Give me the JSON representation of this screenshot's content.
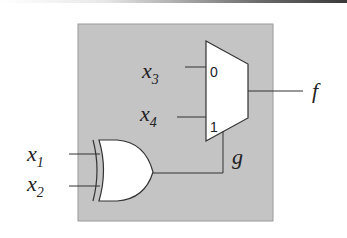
{
  "diagram": {
    "type": "logic-circuit",
    "block_color": "#c4c4c4",
    "gate": {
      "kind": "XOR",
      "inputs": [
        "x1",
        "x2"
      ],
      "output": "g"
    },
    "mux": {
      "inputs": {
        "0": "x3",
        "1": "x4"
      },
      "select": "g",
      "output": "f",
      "pin_labels": [
        "0",
        "1"
      ]
    },
    "labels": {
      "x1": {
        "base": "x",
        "sub": "1"
      },
      "x2": {
        "base": "x",
        "sub": "2"
      },
      "x3": {
        "base": "x",
        "sub": "3"
      },
      "x4": {
        "base": "x",
        "sub": "4"
      },
      "g": "g",
      "f": "f"
    }
  }
}
